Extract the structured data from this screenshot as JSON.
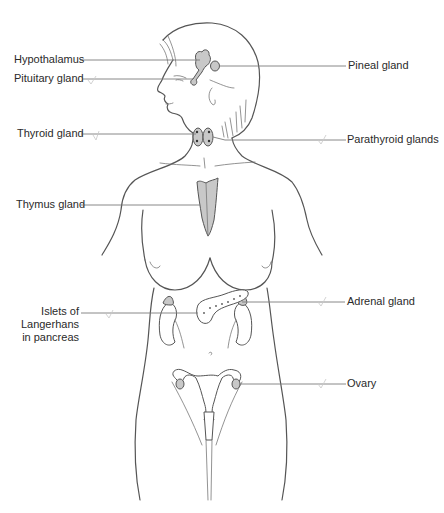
{
  "diagram": {
    "colors": {
      "gland_fill": "#c8c8c8",
      "outline": "#555555",
      "leader_line": "#7a7a7a",
      "label_text": "#2a2a2a",
      "background": "#ffffff"
    },
    "labels": {
      "hypothalamus": "Hypothalamus",
      "pituitary": "Pituitary gland",
      "pineal": "Pineal gland",
      "thyroid": "Thyroid gland",
      "parathyroid": "Parathyroid glands",
      "thymus": "Thymus gland",
      "islets_line1": "Islets of",
      "islets_line2": "Langerhans",
      "islets_line3": "in pancreas",
      "adrenal": "Adrenal gland",
      "ovary": "Ovary"
    },
    "icons": {
      "figure": "female-body-outline",
      "tick_mark": "checkmark"
    }
  }
}
